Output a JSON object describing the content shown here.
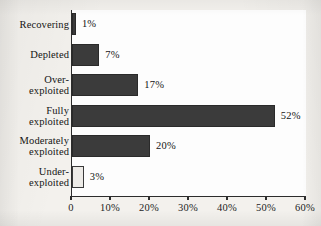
{
  "chart_data": {
    "type": "bar",
    "orientation": "horizontal",
    "title": "",
    "xlabel": "",
    "ylabel": "",
    "categories": [
      "Recovering",
      "Depleted",
      "Over-\nexploited",
      "Fully\nexploited",
      "Moderately\nexploited",
      "Under-\nexploited"
    ],
    "values": [
      1,
      7,
      17,
      52,
      20,
      3
    ],
    "value_labels": [
      "1%",
      "7%",
      "17%",
      "52%",
      "20%",
      "3%"
    ],
    "bar_styles": [
      "dark",
      "dark",
      "dark",
      "dark",
      "dark",
      "light"
    ],
    "xlim": [
      0,
      60
    ],
    "xticks": [
      0,
      10,
      20,
      30,
      40,
      50,
      60
    ],
    "xtick_labels": [
      "0",
      "10%",
      "20%",
      "30%",
      "40%",
      "50%",
      "60%"
    ],
    "grid": false,
    "legend": null,
    "colors": {
      "bar_dark": "#3b3b3b",
      "bar_light": "#edebe7",
      "bar_outline": "#2a2a2a",
      "axis": "#2c2c2c",
      "text": "#141414",
      "plot_background": "#fdfdfd",
      "page_background": "#f3f1ed"
    }
  }
}
